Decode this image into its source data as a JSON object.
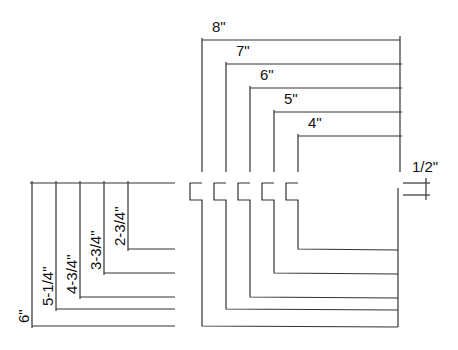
{
  "diagram": {
    "type": "nested-L-frame-dimension-drawing",
    "line_color": "#333333",
    "background": "#ffffff",
    "top_dimensions": {
      "labels": [
        "8\"",
        "7\"",
        "6\"",
        "5\"",
        "4\""
      ],
      "right_edge_x": 400,
      "lines": [
        {
          "label": "8\"",
          "x_start": 202,
          "y": 40
        },
        {
          "label": "7\"",
          "x_start": 226,
          "y": 64
        },
        {
          "label": "6\"",
          "x_start": 250,
          "y": 88
        },
        {
          "label": "5\"",
          "x_start": 274,
          "y": 112
        },
        {
          "label": "4\"",
          "x_start": 298,
          "y": 136
        }
      ]
    },
    "notch_dimension": {
      "label": "1/2\""
    },
    "left_dimensions": {
      "labels": [
        "6\"",
        "5-1/4\"",
        "4-3/4\"",
        "3-3/4\"",
        "2-3/4\""
      ],
      "top_y": 183,
      "lines": [
        {
          "label": "6\"",
          "x": 32,
          "y_end": 326
        },
        {
          "label": "5-1/4\"",
          "x": 56,
          "y_end": 309
        },
        {
          "label": "4-3/4\"",
          "x": 80,
          "y_end": 297
        },
        {
          "label": "3-3/4\"",
          "x": 104,
          "y_end": 273
        },
        {
          "label": "2-3/4\"",
          "x": 128,
          "y_end": 249
        }
      ]
    }
  }
}
